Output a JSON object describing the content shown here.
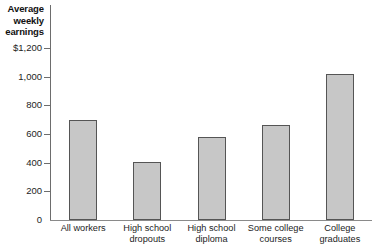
{
  "chart_data": {
    "type": "bar",
    "title": "Average\nweekly\nearnings",
    "xlabel": "",
    "ylabel": "",
    "categories": [
      "All workers",
      "High school\ndropouts",
      "High school\ndiploma",
      "Some college\ncourses",
      "College\ngraduates"
    ],
    "values": [
      700,
      405,
      580,
      660,
      1020
    ],
    "ylim": [
      0,
      1200
    ],
    "yticks": [
      0,
      200,
      400,
      600,
      800,
      1000,
      1200
    ],
    "ytick_labels": [
      "0",
      "200",
      "400",
      "600",
      "800",
      "1,000",
      "$1,200"
    ],
    "grid": false,
    "legend": null,
    "series": [
      {
        "name": "Average weekly earnings",
        "values": [
          700,
          405,
          580,
          660,
          1020
        ]
      }
    ]
  },
  "style": {
    "bar_fill": "#c7c7c7",
    "bar_stroke": "#555555",
    "axis_color": "#6d6d6d",
    "text_color": "#1d1d1d"
  }
}
